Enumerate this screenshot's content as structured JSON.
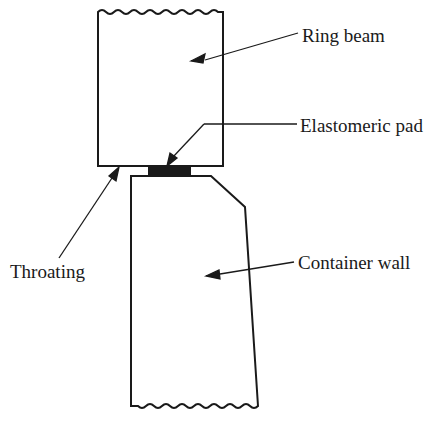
{
  "diagram": {
    "labels": {
      "ring_beam": "Ring beam",
      "elastomeric_pad": "Elastomeric pad",
      "throating": "Throating",
      "container_wall": "Container wall"
    },
    "colors": {
      "line": "#1a1a1a",
      "pad_fill": "#1a1a1a",
      "background": "#ffffff"
    }
  }
}
